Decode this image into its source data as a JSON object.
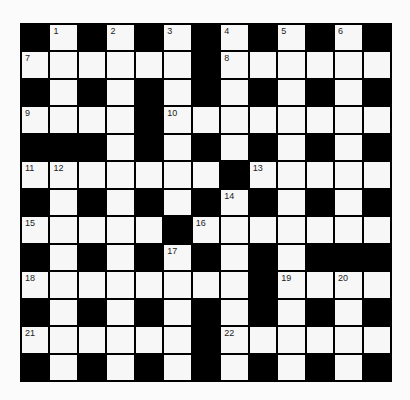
{
  "puzzle": {
    "rows": 13,
    "cols": 13,
    "grid": [
      "#.#.#.#.#.#.#",
      "......#......",
      "#.#.#.#.#.#.#",
      "....#........",
      "###.#.#.#.#.#",
      ".......#.....",
      "#.#.#.#.#.#.#",
      ".....#.......",
      "#.#.#.#.#.###",
      "........#....",
      "#.#.#.#.#.#.#",
      "......#......",
      "#.#.#.#.#.#.#"
    ],
    "numbers": [
      {
        "row": 0,
        "col": 1,
        "n": "1"
      },
      {
        "row": 0,
        "col": 3,
        "n": "2"
      },
      {
        "row": 0,
        "col": 5,
        "n": "3"
      },
      {
        "row": 0,
        "col": 7,
        "n": "4"
      },
      {
        "row": 0,
        "col": 9,
        "n": "5"
      },
      {
        "row": 0,
        "col": 11,
        "n": "6"
      },
      {
        "row": 1,
        "col": 0,
        "n": "7"
      },
      {
        "row": 1,
        "col": 7,
        "n": "8"
      },
      {
        "row": 3,
        "col": 0,
        "n": "9"
      },
      {
        "row": 3,
        "col": 5,
        "n": "10"
      },
      {
        "row": 5,
        "col": 0,
        "n": "11"
      },
      {
        "row": 5,
        "col": 1,
        "n": "12"
      },
      {
        "row": 5,
        "col": 8,
        "n": "13"
      },
      {
        "row": 6,
        "col": 7,
        "n": "14"
      },
      {
        "row": 7,
        "col": 0,
        "n": "15"
      },
      {
        "row": 7,
        "col": 6,
        "n": "16"
      },
      {
        "row": 8,
        "col": 5,
        "n": "17"
      },
      {
        "row": 9,
        "col": 0,
        "n": "18"
      },
      {
        "row": 9,
        "col": 9,
        "n": "19"
      },
      {
        "row": 9,
        "col": 11,
        "n": "20"
      },
      {
        "row": 11,
        "col": 0,
        "n": "21"
      },
      {
        "row": 11,
        "col": 7,
        "n": "22"
      }
    ],
    "colors": {
      "block": "#000000",
      "cell": "#f7f7f7",
      "number": "#222222"
    }
  }
}
